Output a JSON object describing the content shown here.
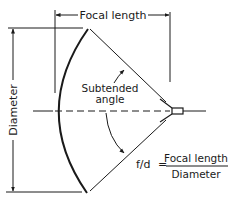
{
  "diagram": {
    "labels": {
      "focal_length": "Focal length",
      "diameter": "Diameter",
      "subtended_line1": "Subtended",
      "subtended_line2": "angle",
      "ratio_lhs": "f/d",
      "ratio_eq": "=",
      "ratio_numerator": "Focal length",
      "ratio_denominator": "Diameter"
    },
    "colors": {
      "line": "#1a1a1a",
      "background": "#ffffff"
    }
  }
}
